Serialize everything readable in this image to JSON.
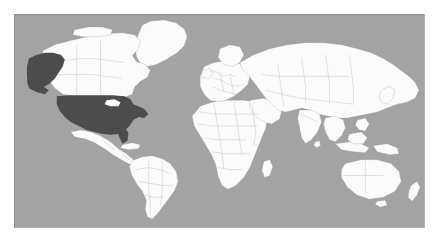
{
  "page": {
    "background_color": "#ffffff",
    "width": 439,
    "height": 242
  },
  "map": {
    "name": "world-map",
    "projection": "equirectangular",
    "panel": {
      "left": 14,
      "top": 14,
      "width": 411,
      "height": 214
    },
    "colors": {
      "ocean": "#a3a3a3",
      "land": "#fbfbfb",
      "highlight": "#4c4c4c",
      "country_border": "#c9c9c9",
      "panel_border": "#8d8d8d"
    },
    "highlighted_regions": [
      {
        "name": "United States (contiguous)",
        "color": "#4c4c4c"
      },
      {
        "name": "Alaska",
        "color": "#4c4c4c"
      }
    ],
    "legend": {
      "visible": false,
      "entries": []
    },
    "labels": {
      "visible": false,
      "entries": []
    },
    "continents": [
      "North America",
      "South America",
      "Europe",
      "Africa",
      "Asia",
      "Australia",
      "Greenland",
      "Antarctica (not shown)"
    ]
  }
}
